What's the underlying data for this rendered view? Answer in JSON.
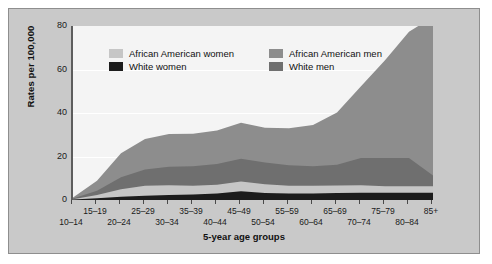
{
  "chart_data": {
    "type": "area",
    "stacked": true,
    "title": "",
    "subtitle": "",
    "xlabel": "5-year age groups",
    "ylabel": "Rates per 100,000",
    "ylim": [
      0,
      80
    ],
    "yticks": [
      0,
      20,
      40,
      60,
      80
    ],
    "grid": true,
    "legend_position": "inside-top-left",
    "categories": [
      "10–14",
      "15–19",
      "20–24",
      "25–29",
      "30–34",
      "35–39",
      "40–44",
      "45–49",
      "50–54",
      "55–59",
      "60–64",
      "65–69",
      "70–74",
      "75–79",
      "80–84",
      "85+"
    ],
    "x_labels_top": [
      "15–19",
      "25–29",
      "35–39",
      "45–49",
      "55–59",
      "65–69",
      "75–79",
      "85+"
    ],
    "x_labels_bottom": [
      "10–14",
      "20–24",
      "30–34",
      "40–44",
      "50–54",
      "60–64",
      "70–74",
      "80–84"
    ],
    "series": [
      {
        "name": "African American men",
        "color": "#8d8d8d",
        "values": [
          0.4,
          4.5,
          11.0,
          14.0,
          15.0,
          15.0,
          15.5,
          16.5,
          16.0,
          17.0,
          19.0,
          24.0,
          33.0,
          45.0,
          58.0,
          73.0
        ]
      },
      {
        "name": "White men",
        "color": "#6f6f6f",
        "values": [
          0.3,
          2.0,
          5.5,
          7.5,
          8.5,
          9.0,
          9.5,
          10.5,
          10.0,
          9.5,
          9.0,
          9.5,
          12.5,
          13.0,
          13.0,
          5.0
        ]
      },
      {
        "name": "African American women",
        "color": "#c6c6c6",
        "values": [
          0.2,
          1.5,
          3.5,
          4.5,
          4.5,
          4.0,
          4.0,
          4.5,
          4.0,
          3.5,
          3.5,
          3.5,
          3.5,
          3.0,
          3.0,
          3.0
        ]
      },
      {
        "name": "White women",
        "color": "#1c1c1c",
        "values": [
          0.2,
          0.8,
          1.5,
          2.0,
          2.3,
          2.5,
          3.0,
          4.0,
          3.2,
          3.0,
          3.0,
          3.2,
          3.3,
          3.3,
          3.3,
          3.3
        ]
      }
    ]
  },
  "legend": {
    "entries": [
      {
        "label": "African American women",
        "color": "#c6c6c6"
      },
      {
        "label": "African American men",
        "color": "#8d8d8d"
      },
      {
        "label": "White women",
        "color": "#1c1c1c"
      },
      {
        "label": "White men",
        "color": "#6f6f6f"
      }
    ]
  },
  "axes": {
    "y_title": "Rates per 100,000",
    "x_title": "5-year age groups",
    "y_tick_labels": [
      "80",
      "60",
      "40",
      "20",
      "0"
    ]
  }
}
